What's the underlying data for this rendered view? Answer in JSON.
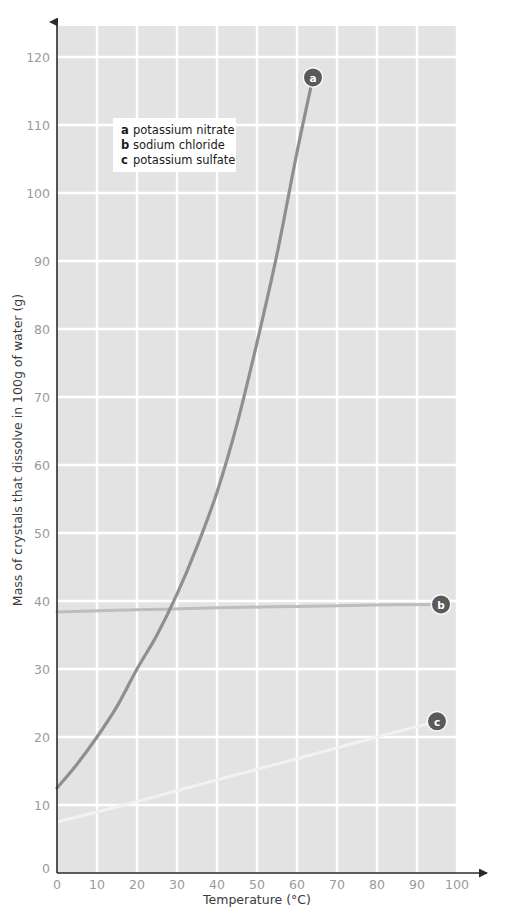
{
  "chart_data": {
    "type": "line",
    "title": "",
    "xlabel": "Temperature (°C)",
    "ylabel": "Mass of crystals that dissolve in 100g of water (g)",
    "xlim": [
      0,
      100
    ],
    "ylim": [
      0,
      120
    ],
    "xticks": [
      0,
      10,
      20,
      30,
      40,
      50,
      60,
      70,
      80,
      90,
      100
    ],
    "yticks": [
      0,
      10,
      20,
      30,
      40,
      50,
      60,
      70,
      80,
      90,
      100,
      110,
      120
    ],
    "grid": true,
    "legend_position": "upper-left-inside",
    "series": [
      {
        "key": "a",
        "name": "potassium nitrate",
        "color": "#8f8f8f",
        "label_marker": "a",
        "x": [
          0,
          5,
          10,
          15,
          20,
          25,
          30,
          35,
          40,
          45,
          50,
          55,
          60,
          64
        ],
        "y": [
          12.5,
          16,
          20,
          24.5,
          30,
          35,
          41,
          48,
          56,
          66,
          78,
          91,
          106,
          117
        ]
      },
      {
        "key": "b",
        "name": "sodium chloride",
        "color": "#bdbdbd",
        "label_marker": "b",
        "x": [
          0,
          20,
          40,
          60,
          80,
          96
        ],
        "y": [
          38.4,
          38.7,
          39.0,
          39.2,
          39.4,
          39.5
        ]
      },
      {
        "key": "c",
        "name": "potassium sulfate",
        "color": "#f2f2f2",
        "label_marker": "c",
        "x": [
          0,
          20,
          40,
          60,
          80,
          95
        ],
        "y": [
          7.5,
          10.5,
          13.7,
          16.8,
          20.0,
          22.3
        ]
      }
    ],
    "markers": [
      {
        "label": "a",
        "x": 64,
        "y": 117
      },
      {
        "label": "b",
        "x": 96,
        "y": 39.5
      },
      {
        "label": "c",
        "x": 95,
        "y": 22.3
      }
    ],
    "legend": [
      {
        "letter": "a",
        "label": "potassium nitrate"
      },
      {
        "letter": "b",
        "label": "sodium chloride"
      },
      {
        "letter": "c",
        "label": "potassium sulfate"
      }
    ],
    "colors": {
      "plot_background": "#e3e3e3",
      "gridline": "#ffffff",
      "axis": "#2b2b2b",
      "tick_label": "#9a9a9a",
      "axis_title": "#3a3a3a",
      "marker_fill": "#5a5a5a",
      "marker_text": "#ffffff",
      "legend_background": "#ffffff"
    }
  }
}
